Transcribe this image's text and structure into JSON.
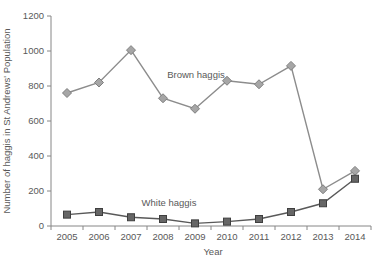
{
  "chart_data": {
    "type": "line",
    "title": "",
    "xlabel": "Year",
    "ylabel": "Number of haggis in St Andrews' Population",
    "categories": [
      "2005",
      "2006",
      "2007",
      "2008",
      "2009",
      "2010",
      "2011",
      "2012",
      "2013",
      "2014"
    ],
    "series": [
      {
        "name": "Brown haggis",
        "marker": "diamond",
        "line_color": "#8c8c8c",
        "marker_fill": "#a6a6a6",
        "marker_stroke": "#7f7f7f",
        "values": [
          760,
          820,
          1005,
          730,
          670,
          830,
          810,
          915,
          210,
          315
        ]
      },
      {
        "name": "White haggis",
        "marker": "square",
        "line_color": "#595959",
        "marker_fill": "#666666",
        "marker_stroke": "#3f3f3f",
        "values": [
          65,
          80,
          50,
          40,
          15,
          25,
          40,
          80,
          130,
          270
        ]
      }
    ],
    "ylim": [
      0,
      1200
    ],
    "ytick_step": 200,
    "grid": false,
    "legend": "inline-labels",
    "annotations": [
      {
        "text": "Brown haggis",
        "x": 196,
        "y": 78
      },
      {
        "text": "White haggis",
        "x": 169,
        "y": 206
      }
    ],
    "axis_color": "#868686",
    "text_color": "#595959",
    "layout": {
      "plot_left": 51,
      "plot_top": 16,
      "plot_bottom": 226,
      "plot_right": 371,
      "tick_len": 4,
      "ylabel_x": 10,
      "ylabel_y": 121,
      "xlabel_x": 213,
      "xlabel_y": 255
    }
  }
}
